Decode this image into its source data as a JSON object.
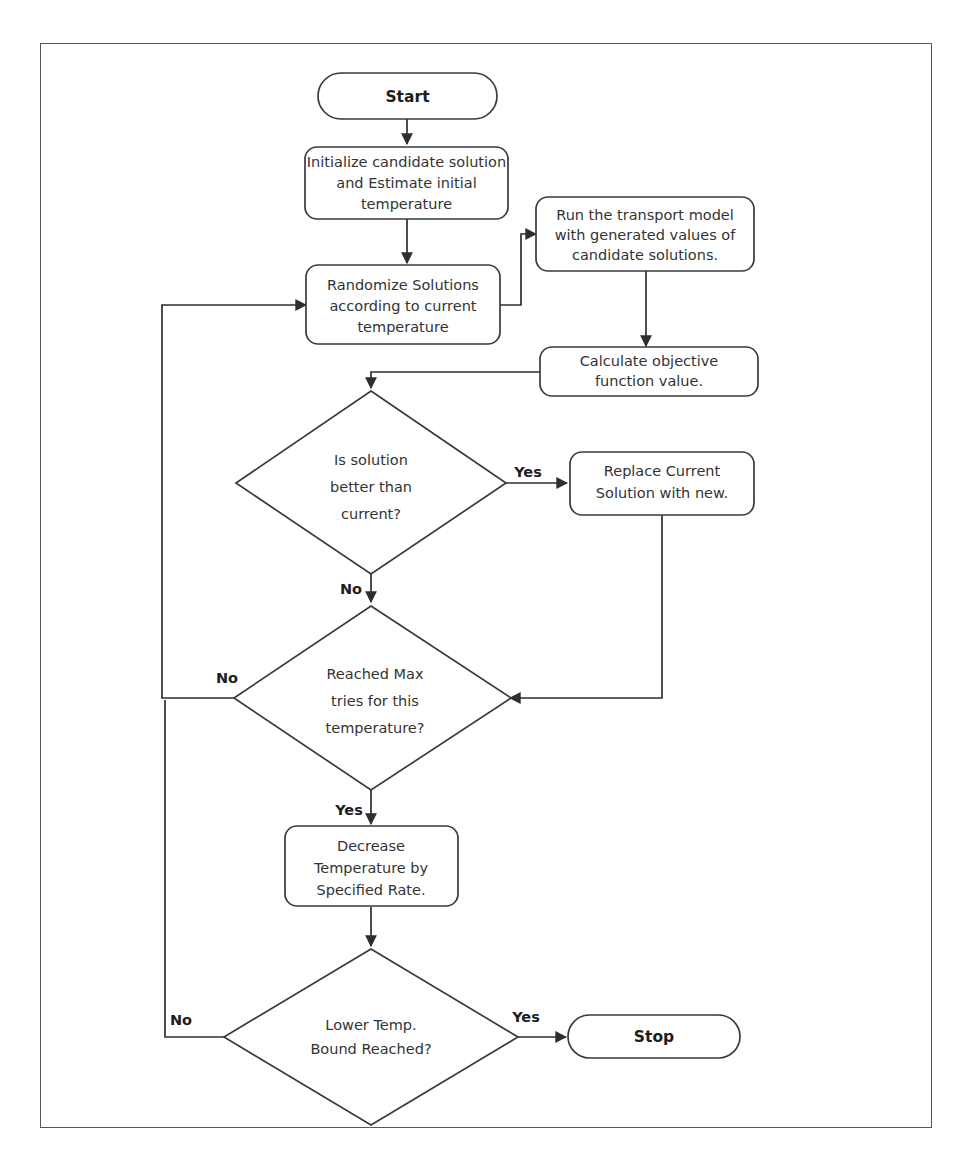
{
  "diagram": {
    "colors": {
      "frame_border": "#58585c",
      "node_stroke": "#3a3a3c",
      "node_fill": "#ffffff",
      "edge_stroke": "#2e2e30",
      "text": "#333335",
      "label_text": "#1d1d1f",
      "background": "#ffffff"
    },
    "nodes": [
      {
        "id": "start",
        "type": "terminator",
        "label": "Start",
        "lines": [
          "Start"
        ]
      },
      {
        "id": "initialize",
        "type": "process",
        "label": "Initialize candidate solution and Estimate initial temperature",
        "lines": [
          "Initialize candidate solution",
          "and Estimate initial",
          "temperature"
        ]
      },
      {
        "id": "randomize",
        "type": "process",
        "label": "Randomize Solutions according to current temperature",
        "lines": [
          "Randomize Solutions",
          "according to current",
          "temperature"
        ]
      },
      {
        "id": "run-model",
        "type": "process",
        "label": "Run the transport model with generated values of candidate solutions.",
        "lines": [
          "Run the transport model",
          "with generated values of",
          "candidate solutions."
        ]
      },
      {
        "id": "calculate",
        "type": "process",
        "label": "Calculate objective function value.",
        "lines": [
          "Calculate objective",
          "function value."
        ]
      },
      {
        "id": "is-better",
        "type": "decision",
        "label": "Is solution better than current?",
        "lines": [
          "Is solution",
          "better than",
          "current?"
        ]
      },
      {
        "id": "replace",
        "type": "process",
        "label": "Replace Current Solution with new.",
        "lines": [
          "Replace Current",
          "Solution with new."
        ]
      },
      {
        "id": "max-tries",
        "type": "decision",
        "label": "Reached Max tries for this temperature?",
        "lines": [
          "Reached Max",
          "tries for this",
          "temperature?"
        ]
      },
      {
        "id": "decrease-temp",
        "type": "process",
        "label": "Decrease Temperature by Specified Rate.",
        "lines": [
          "Decrease",
          "Temperature by",
          "Specified Rate."
        ]
      },
      {
        "id": "lower-bound",
        "type": "decision",
        "label": "Lower Temp. Bound Reached?",
        "lines": [
          "Lower Temp.",
          "Bound Reached?"
        ]
      },
      {
        "id": "stop",
        "type": "terminator",
        "label": "Stop",
        "lines": [
          "Stop"
        ]
      }
    ],
    "edge_labels": {
      "is_better_yes": "Yes",
      "is_better_no": "No",
      "max_tries_no": "No",
      "max_tries_yes": "Yes",
      "lower_bound_no": "No",
      "lower_bound_yes": "Yes"
    }
  }
}
